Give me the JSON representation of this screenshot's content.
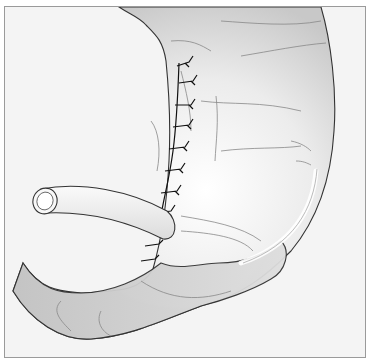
{
  "figure": {
    "colors": {
      "background": "#f4f4f4",
      "border": "#9a9a9a",
      "organ_fill": "#d9d9d9",
      "organ_highlight": "#ffffff",
      "outline": "#333333",
      "fold_lines": "#888888",
      "sutures": "#111111",
      "tube_fill": "#f2f2f2"
    }
  }
}
